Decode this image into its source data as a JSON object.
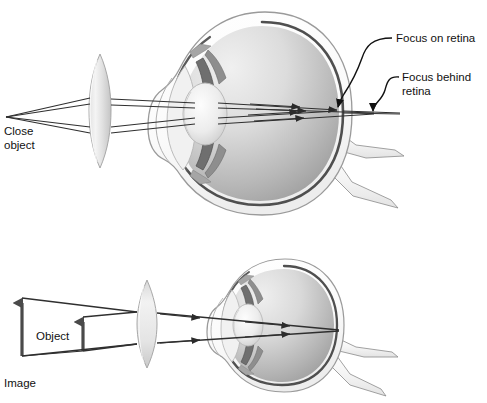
{
  "figure": {
    "background_color": "#ffffff",
    "width": 487,
    "height": 403
  },
  "palette": {
    "ink": "#1a1a1a",
    "ray": "#333333",
    "sclera_fill": "#fbfbfb",
    "sclera_edge": "#8f8f8f",
    "choroid_line": "#4a4a4a",
    "vitreous_light": "#ebebeb",
    "vitreous_mid": "#c9c9c9",
    "vitreous_dark": "#9a9a9a",
    "lens_light": "#f4f4f4",
    "lens_mid": "#d2d2d2",
    "iris_dark": "#6b6b6b",
    "optic_nerve": "#efefef",
    "corrective_lens_light": "#f2f2f2",
    "corrective_lens_mid": "#cfcfcf",
    "text": "#111111"
  },
  "panels": [
    {
      "id": "top-panel",
      "name": "uncorrected-and-corrected-close-object",
      "labels": [
        {
          "id": "close-object",
          "text_lines": [
            "Close",
            "object"
          ],
          "x": 4,
          "y": 128
        },
        {
          "id": "focus-on-retina",
          "text_lines": [
            "Focus on retina"
          ],
          "x": 396,
          "y": 41
        },
        {
          "id": "focus-behind-retina",
          "text_lines": [
            "Focus behind",
            "retina"
          ],
          "x": 402,
          "y": 80
        }
      ],
      "annotations": [
        {
          "id": "leader-focus-on-retina",
          "points_to_x": 337,
          "points_to_y": 110
        },
        {
          "id": "leader-focus-behind-retina",
          "points_to_x": 374,
          "points_to_y": 113
        }
      ],
      "object_point": {
        "x": 6,
        "y": 117
      },
      "corrective_lens": {
        "cx": 100,
        "cy": 110,
        "half_width": 9,
        "half_height": 56
      },
      "eye": {
        "cx": 258,
        "cy": 113,
        "rx": 92,
        "ry": 101
      }
    },
    {
      "id": "bottom-panel",
      "name": "image-formed-by-corrective-lens",
      "labels": [
        {
          "id": "object",
          "text_lines": [
            "Object"
          ],
          "x": 36,
          "y": 336
        },
        {
          "id": "image",
          "text_lines": [
            "Image"
          ],
          "x": 4,
          "y": 383
        }
      ],
      "arrows": [
        {
          "id": "image-arrow",
          "x": 22,
          "base_y": 356,
          "tip_y": 297,
          "label": "Image"
        },
        {
          "id": "object-arrow",
          "x": 83,
          "base_y": 351,
          "tip_y": 316,
          "label": "Object"
        }
      ],
      "corrective_lens": {
        "cx": 147,
        "cy": 324,
        "half_width": 8,
        "half_height": 45
      },
      "eye": {
        "cx": 280,
        "cy": 325,
        "rx": 62,
        "ry": 66
      },
      "focus_point": {
        "x": 339,
        "y": 330
      }
    }
  ],
  "ray_bundle": {
    "top_panel_ray_count": 4,
    "bottom_panel_ray_count": 2,
    "arrowheads_on_rays": true
  }
}
